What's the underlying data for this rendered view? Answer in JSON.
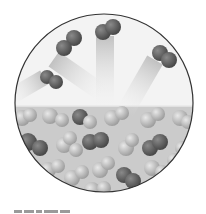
{
  "figure": {
    "regions": {
      "vapor": {
        "label": "vapor phase",
        "color": "#f2f2f2"
      },
      "liquid": {
        "label": "liquid phase",
        "color": "#c8c8c8"
      }
    },
    "colors": {
      "outline": "#333333",
      "molecule_dark": "#5a5a5a",
      "molecule_light": "#bdbdbd",
      "trail": "#d9d9d9"
    },
    "vapor_molecules": [
      {
        "x": 70,
        "y": 43,
        "angle": -40
      },
      {
        "x": 110,
        "y": 30,
        "angle": -20
      },
      {
        "x": 163,
        "y": 55,
        "angle": 30
      },
      {
        "x": 52,
        "y": 80,
        "angle": 20
      }
    ],
    "caption": ""
  }
}
